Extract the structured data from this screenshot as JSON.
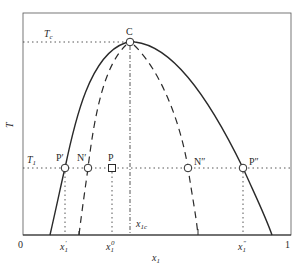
{
  "diagram": {
    "type": "phase-diagram",
    "title": "",
    "axes": {
      "x_label": "x",
      "x_label_sub": "1",
      "y_label": "T",
      "x_tick_start": "0",
      "x_tick_end": "1"
    },
    "horizontal_lines": {
      "critical_temperature": {
        "label": "T",
        "sub": "c"
      },
      "temperature_t1": {
        "label": "T",
        "sub": "1"
      }
    },
    "critical_point": {
      "label": "C"
    },
    "points": {
      "p_prime": {
        "label": "P′"
      },
      "n_prime": {
        "label": "N′"
      },
      "p": {
        "label": "P"
      },
      "n_double_prime": {
        "label": "N″"
      },
      "p_double_prime": {
        "label": "P″"
      }
    },
    "composition_markers": {
      "x1_prime": {
        "label": "x",
        "sub": "1",
        "sup": "′"
      },
      "x1_zero": {
        "label": "x",
        "sub": "1",
        "sup": "0"
      },
      "x1c": {
        "label": "x",
        "sub": "1c"
      },
      "x1_double_prime": {
        "label": "x",
        "sub": "1",
        "sup": "″"
      }
    },
    "curves": {
      "binodal": {
        "style": "solid"
      },
      "spinodal": {
        "style": "dashed"
      }
    },
    "colors": {
      "line": "#2a2a2a",
      "background": "#ffffff"
    }
  }
}
